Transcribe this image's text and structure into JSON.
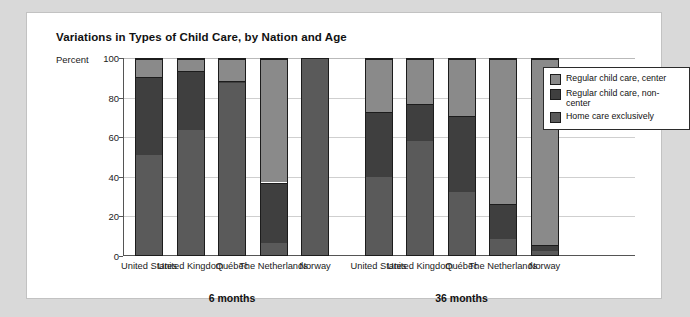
{
  "title": "Variations in Types of Child Care, by Nation and Age",
  "axis": {
    "percent_word": "Percent",
    "yticks": [
      "100",
      "80",
      "60",
      "40",
      "20",
      "0"
    ]
  },
  "legend": {
    "items": [
      {
        "label": "Regular child care, center",
        "color": "#8a8a8a"
      },
      {
        "label": "Regular child care, non-center",
        "color": "#3f3f3f"
      },
      {
        "label": "Home care exclusively",
        "color": "#5a5a5a"
      }
    ]
  },
  "groups": [
    {
      "label": "6 months"
    },
    {
      "label": "36 months"
    }
  ],
  "categories": [
    "United States",
    "United Kingdom",
    "Québec",
    "The Netherlands",
    "Norway",
    "United States",
    "United Kingdom",
    "Québec",
    "The Netherlands",
    "Norway"
  ],
  "chart_data": {
    "type": "bar",
    "title": "Variations in Types of Child Care, by Nation and Age",
    "subtitle": "",
    "stacked": true,
    "xlabel": "",
    "ylabel": "Percent",
    "ylim": [
      0,
      100
    ],
    "yticks": [
      0,
      20,
      40,
      60,
      80,
      100
    ],
    "grid": true,
    "legend_position": "right",
    "group_labels": [
      "6 months",
      "36 months"
    ],
    "categories": [
      "United States",
      "United Kingdom",
      "Québec",
      "The Netherlands",
      "Norway",
      "United States",
      "United Kingdom",
      "Québec",
      "The Netherlands",
      "Norway"
    ],
    "series": [
      {
        "name": "Home care exclusively",
        "color": "#5a5a5a",
        "values": [
          51,
          64,
          88,
          6,
          100,
          40,
          58,
          32,
          8,
          2
        ]
      },
      {
        "name": "Regular child care, non-center",
        "color": "#3f3f3f",
        "values": [
          40,
          30,
          1,
          31,
          0,
          33,
          19,
          39,
          18,
          3
        ]
      },
      {
        "name": "Regular child care, center",
        "color": "#8a8a8a",
        "values": [
          9,
          6,
          11,
          63,
          0,
          27,
          23,
          29,
          74,
          95
        ]
      }
    ]
  }
}
